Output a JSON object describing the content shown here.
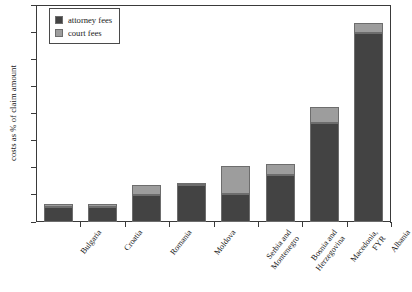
{
  "chart_data": {
    "type": "bar",
    "subtype": "stacked-bar",
    "title": "",
    "xlabel": "",
    "ylabel": "costs as % of claim amount",
    "ylim": [
      0,
      160
    ],
    "ytick_step": 20,
    "yticks": [
      0,
      20,
      40,
      60,
      80,
      100,
      120,
      140,
      160
    ],
    "grid": false,
    "legend_position": "top-left",
    "categories": [
      "Bulgaria",
      "Croatia",
      "Romania",
      "Moldova",
      "Serbia and Montenegro",
      "Bosnia and Herzegovina",
      "Macedonia, FYR",
      "Albania"
    ],
    "category_lines": [
      [
        "Bulgaria",
        ""
      ],
      [
        "Croatia",
        ""
      ],
      [
        "Romania",
        ""
      ],
      [
        "Moldova",
        ""
      ],
      [
        "Serbia and",
        "Montenegro"
      ],
      [
        "Bosnia and",
        "Herzegovina"
      ],
      [
        "Macedonia,",
        "FYR"
      ],
      [
        "Albania",
        ""
      ]
    ],
    "series": [
      {
        "name": "attorney fees",
        "color": "#434343",
        "values": [
          11,
          11,
          20,
          27,
          21,
          35,
          73,
          139
        ]
      },
      {
        "name": "court fees",
        "color": "#9d9d9d",
        "values": [
          2,
          2,
          7,
          2,
          20,
          8,
          12,
          8
        ]
      }
    ],
    "totals": [
      13,
      13,
      27,
      29,
      41,
      43,
      85,
      147
    ]
  },
  "legend": {
    "items": [
      {
        "label": "attorney fees",
        "color": "#434343"
      },
      {
        "label": "court fees",
        "color": "#9d9d9d"
      }
    ]
  },
  "axis": {
    "y_title": "costs as % of claim amount"
  }
}
